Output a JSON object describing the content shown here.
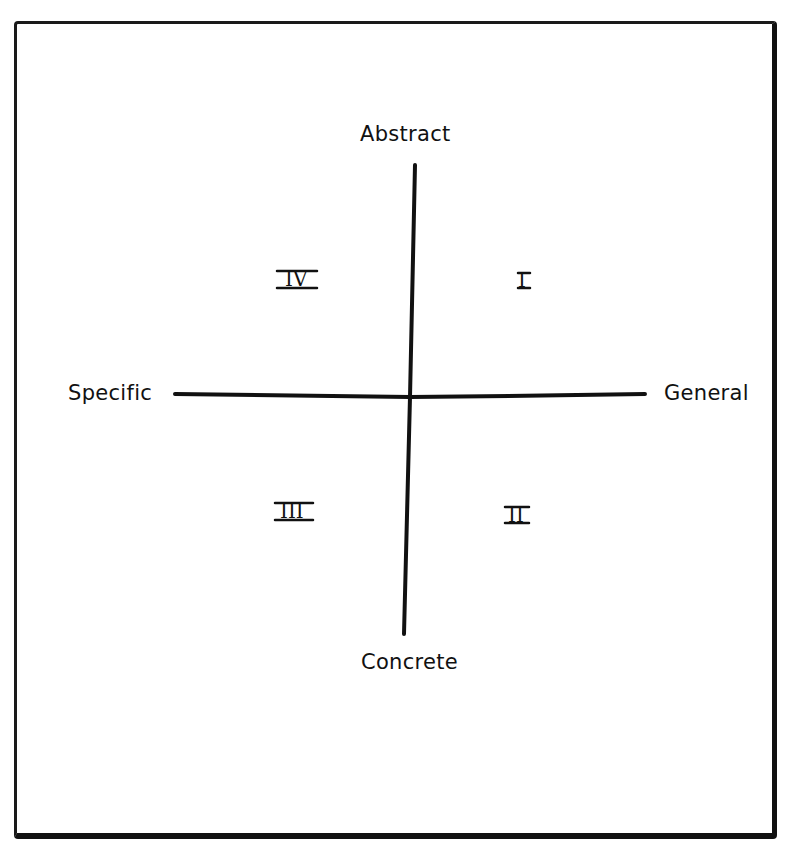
{
  "diagram": {
    "axes": {
      "top": "Abstract",
      "bottom": "Concrete",
      "left": "Specific",
      "right": "General"
    },
    "quadrants": [
      {
        "id": "I",
        "label": "I",
        "position": "upper-right"
      },
      {
        "id": "II",
        "label": "II",
        "position": "lower-right"
      },
      {
        "id": "III",
        "label": "III",
        "position": "lower-left"
      },
      {
        "id": "IV",
        "label": "IV",
        "position": "upper-left"
      }
    ],
    "colors": {
      "ink": "#111111",
      "background": "#ffffff"
    }
  }
}
